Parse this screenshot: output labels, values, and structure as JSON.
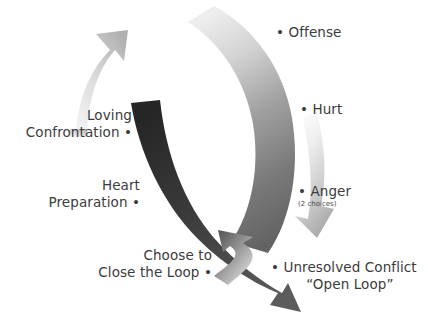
{
  "diagram": {
    "type": "cycle-diagram",
    "background_color": "#ffffff",
    "text_color": "#3b3b3b",
    "nodes": [
      {
        "id": "offense",
        "label": "Offense",
        "side": "right",
        "bullet": "•",
        "text": "• Offense"
      },
      {
        "id": "hurt",
        "label": "Hurt",
        "side": "right",
        "bullet": "•",
        "text": "• Hurt"
      },
      {
        "id": "anger",
        "label": "Anger",
        "sublabel": "(2 choices)",
        "side": "right",
        "bullet": "•",
        "text": "• Anger"
      },
      {
        "id": "unresolved-conflict",
        "label": "Unresolved Conflict",
        "sublabel": "“Open Loop”",
        "side": "right",
        "bullet": "•",
        "text": "• Unresolved Conflict"
      },
      {
        "id": "choose-to-close-the-loop",
        "line1": "Choose to",
        "line2": "Close the Loop",
        "side": "left",
        "bullet": "•",
        "text": "Close the Loop •"
      },
      {
        "id": "heart-preparation",
        "line1": "Heart",
        "line2": "Preparation",
        "side": "left",
        "bullet": "•",
        "text": "Preparation •"
      },
      {
        "id": "loving-confrontation",
        "line1": "Loving",
        "line2": "Confrontation",
        "side": "left",
        "bullet": "•",
        "text": "Confrontation •"
      }
    ],
    "arrows": [
      {
        "id": "outer-descending-arc",
        "from": "offense",
        "to": "unresolved-conflict",
        "direction": "clockwise-down",
        "gradient_start": "#ebebeb",
        "gradient_end": "#6e6e6e"
      },
      {
        "id": "anger-branch-arrow",
        "from": "hurt",
        "to": "unresolved-conflict",
        "direction": "down-right",
        "gradient_start": "#f3f3f3",
        "gradient_end": "#a9a9a9"
      },
      {
        "id": "dark-closing-arc",
        "from": "loving-confrontation",
        "to": "unresolved-conflict",
        "direction": "down-right",
        "gradient_start": "#2f2f2f",
        "gradient_end": "#555555"
      },
      {
        "id": "inner-ascending-arrow",
        "from": "unresolved-conflict",
        "to": "choose-to-close-the-loop",
        "direction": "up-left",
        "gradient_start": "#d6d6d6",
        "gradient_end": "#5e5e5e"
      },
      {
        "id": "loving-confrontation-arrow",
        "from": "heart-preparation",
        "to": "loving-confrontation",
        "direction": "up-right",
        "gradient_start": "#e4e4e4",
        "gradient_end": "#b4b4b4"
      }
    ]
  }
}
